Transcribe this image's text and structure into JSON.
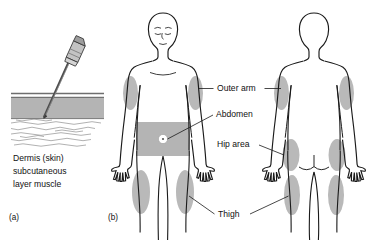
{
  "figure": {
    "background": "#ffffff",
    "ink_color": "#1a1a1a",
    "shade_color": "#b9b9b9",
    "band_color": "#b4b4b4"
  },
  "panels": [
    {
      "id": "a",
      "label": "(a)",
      "name": "needle-skin-cross-section"
    },
    {
      "id": "b",
      "label": "(b)",
      "name": "body-injection-sites"
    }
  ],
  "panel_a": {
    "label": "(a)",
    "caption_lines": [
      "Dermis (skin)",
      "subcutaneous",
      "layer muscle"
    ],
    "caption_text": "Dermis (skin) subcutaneous layer muscle",
    "layers": [
      {
        "name": "dermis",
        "style": "thin line",
        "color": "#6e6e6e"
      },
      {
        "name": "subcutaneous-layer",
        "style": "solid gray band",
        "color": "#b4b4b4"
      },
      {
        "name": "muscle",
        "style": "wavy hatched lines",
        "color": "#8a8a8a"
      }
    ],
    "needle": {
      "name": "syringe-needle",
      "angle_deg": 55,
      "hub_color": "#c9c9c9",
      "shaft_color": "#555555"
    }
  },
  "panel_b": {
    "label": "(b)",
    "figures": [
      {
        "name": "front-body",
        "view": "anterior",
        "has_face": true
      },
      {
        "name": "back-body",
        "view": "posterior",
        "has_face": false
      }
    ],
    "navel": {
      "name": "navel",
      "fill": "#ffffff",
      "center_dot": "#555555"
    },
    "labels": [
      {
        "id": "outer-arm",
        "text": "Outer arm",
        "sites": "both deltoid / outer upper arm regions",
        "leaders": [
          "left",
          "right"
        ]
      },
      {
        "id": "abdomen",
        "text": "Abdomen",
        "sites": "front abdominal band around navel",
        "leaders": [
          "left"
        ]
      },
      {
        "id": "hip-area",
        "text": "Hip area",
        "sites": "posterior hip / gluteal regions",
        "leaders": [
          "left",
          "right"
        ]
      },
      {
        "id": "thigh",
        "text": "Thigh",
        "sites": "outer thigh regions, front and back",
        "leaders": [
          "left",
          "right"
        ]
      }
    ]
  }
}
